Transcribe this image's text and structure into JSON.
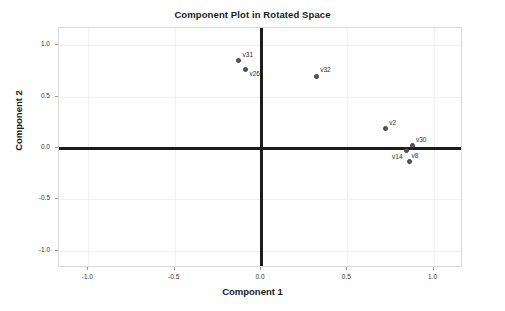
{
  "chart_data": {
    "type": "scatter",
    "title": "Component Plot in Rotated Space",
    "xlabel": "Component 1",
    "ylabel": "Component 2",
    "xlim": [
      -1.17,
      1.17
    ],
    "ylim": [
      -1.17,
      1.17
    ],
    "xticks": [
      "-1.0",
      "-0.5",
      "0.0",
      "0.5",
      "1.0"
    ],
    "xtick_values": [
      -1.0,
      -0.5,
      0.0,
      0.5,
      1.0
    ],
    "yticks": [
      "1.0",
      "0.5",
      "0.0",
      "-0.5",
      "-1.0"
    ],
    "ytick_values": [
      1.0,
      0.5,
      0.0,
      -0.5,
      -1.0
    ],
    "grid": true,
    "legend": null,
    "marker_color": "#5a5a5a",
    "axis_color": "#1c1c1c",
    "grid_color": "#eef0f2",
    "points": [
      {
        "label": "v31",
        "x": -0.13,
        "y": 0.85,
        "label_dx": 4,
        "label_dy": -10
      },
      {
        "label": "v26",
        "x": -0.09,
        "y": 0.77,
        "label_dx": 4,
        "label_dy": 1
      },
      {
        "label": "v32",
        "x": 0.32,
        "y": 0.7,
        "label_dx": 4,
        "label_dy": -10
      },
      {
        "label": "v2",
        "x": 0.72,
        "y": 0.19,
        "label_dx": 4,
        "label_dy": -10
      },
      {
        "label": "v30",
        "x": 0.88,
        "y": 0.02,
        "label_dx": 3,
        "label_dy": -10
      },
      {
        "label": "v14",
        "x": 0.84,
        "y": -0.02,
        "label_dx": -14,
        "label_dy": 3
      },
      {
        "label": "v8",
        "x": 0.86,
        "y": -0.13,
        "label_dx": 2,
        "label_dy": -9
      }
    ]
  }
}
